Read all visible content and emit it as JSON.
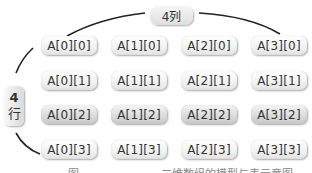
{
  "diagram": {
    "column_label": "4列",
    "row_label": {
      "number": "4",
      "char": "行"
    },
    "highlight_row_index": 2,
    "rows": [
      [
        "A[0][0]",
        "A[1][0]",
        "A[2][0]",
        "A[3][0]"
      ],
      [
        "A[0][1]",
        "A[1][1]",
        "A[2][1]",
        "A[3][1]"
      ],
      [
        "A[0][2]",
        "A[1][2]",
        "A[2][2]",
        "A[3][2]"
      ],
      [
        "A[0][3]",
        "A[1][3]",
        "A[2][3]",
        "A[3][3]"
      ]
    ],
    "caption": "图 　　　　　　　二维数组的模型与表示意图"
  }
}
